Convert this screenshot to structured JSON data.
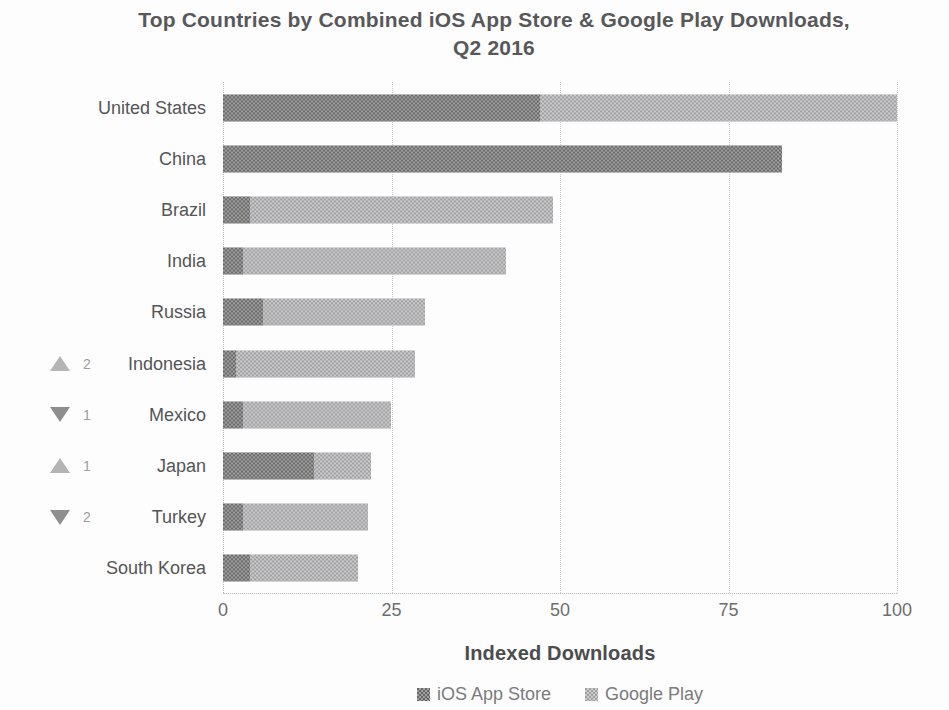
{
  "title": "Top Countries by Combined iOS App Store & Google Play Downloads, Q2 2016",
  "chart_data": {
    "type": "bar",
    "orientation": "horizontal",
    "stacked": true,
    "title": "Top Countries by Combined iOS App Store & Google Play Downloads, Q2 2016",
    "xlabel": "Indexed Downloads",
    "ylabel": "",
    "xlim": [
      0,
      100
    ],
    "xticks": [
      0,
      25,
      50,
      75,
      100
    ],
    "grid": "vertical-dotted",
    "legend_position": "bottom",
    "categories": [
      "United States",
      "China",
      "Brazil",
      "India",
      "Russia",
      "Indonesia",
      "Mexico",
      "Japan",
      "Turkey",
      "South Korea"
    ],
    "series": [
      {
        "name": "iOS App Store",
        "color": "#757577",
        "values": [
          47,
          83,
          4,
          3,
          6,
          2,
          3,
          13.5,
          3,
          4
        ]
      },
      {
        "name": "Google Play",
        "color": "#b3b3b5",
        "values": [
          53,
          0,
          45,
          39,
          24,
          26.5,
          22,
          8.5,
          18.5,
          16
        ]
      }
    ],
    "totals": [
      100,
      83,
      49,
      42,
      30,
      28.5,
      25,
      22,
      21.5,
      20
    ],
    "rank_changes": [
      {
        "country": "Indonesia",
        "direction": "up",
        "places": "2"
      },
      {
        "country": "Mexico",
        "direction": "down",
        "places": "1"
      },
      {
        "country": "Japan",
        "direction": "up",
        "places": "1"
      },
      {
        "country": "Turkey",
        "direction": "down",
        "places": "2"
      }
    ],
    "icons": {
      "up": "rank-up-triangle-icon",
      "down": "rank-down-triangle-icon"
    },
    "colors": {
      "title_text": "#58585a",
      "label_text": "#555557",
      "tick_text": "#6e6e70",
      "gridline": "#cdcdcd",
      "up_triangle": "#b4b4b4",
      "down_triangle": "#8e8e8e"
    }
  }
}
